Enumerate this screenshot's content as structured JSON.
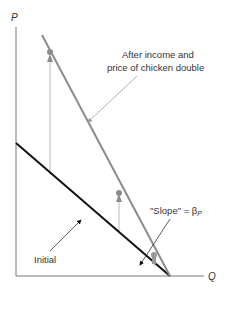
{
  "diagram": {
    "axes": {
      "y_label": "P",
      "x_label": "Q"
    },
    "curves": [
      {
        "name": "Initial",
        "color": "#111111"
      },
      {
        "name": "After income and price of chicken double",
        "color": "#8c8c8c"
      }
    ],
    "annotations": {
      "after_line1": "After income and",
      "after_line2": "price of chicken double",
      "slope_prefix": "\"Slope\" = β",
      "slope_sub": "P",
      "initial": "Initial"
    },
    "colors": {
      "initial": "#111111",
      "after": "#8c8c8c",
      "arrows": "#9a9a9a",
      "axes": "#777777"
    }
  }
}
